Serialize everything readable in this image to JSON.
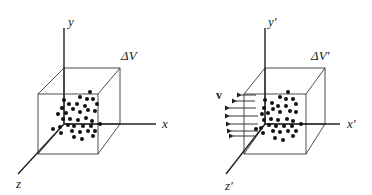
{
  "figure": {
    "left_panel": {
      "axes": {
        "x": "x",
        "y": "y",
        "z": "z"
      },
      "volume_label": "ΔV",
      "particle_count": 36
    },
    "right_panel": {
      "axes": {
        "x": "x′",
        "y": "y′",
        "z": "z′"
      },
      "volume_label": "ΔV′",
      "velocity_label": "v",
      "velocity_arrows": 7,
      "particle_count": 36
    },
    "colors": {
      "ink": "#222222",
      "background": "#ffffff"
    }
  }
}
